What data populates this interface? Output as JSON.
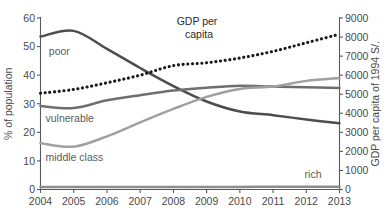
{
  "chart_data": {
    "type": "line",
    "title": "",
    "xlabel": "",
    "ylabel": "% of population",
    "y2label": "GDP per capita of 1994 S/.",
    "grid": false,
    "legend_position": "inline-labels",
    "categories": [
      "2004",
      "2005",
      "2006",
      "2007",
      "2008",
      "2009",
      "2010",
      "2011",
      "2012",
      "2013"
    ],
    "x": [
      2004,
      2005,
      2006,
      2007,
      2008,
      2009,
      2010,
      2011,
      2012,
      2013
    ],
    "xlim": [
      2004,
      2013
    ],
    "ylim": [
      0,
      60
    ],
    "yticks": [
      0,
      10,
      20,
      30,
      40,
      50,
      60
    ],
    "y2lim": [
      0,
      9000
    ],
    "y2ticks": [
      0,
      1000,
      2000,
      3000,
      4000,
      5000,
      6000,
      7000,
      8000,
      9000
    ],
    "series": [
      {
        "name": "poor",
        "axis": "left",
        "style": "solid",
        "color": "#4d4d4d",
        "values": [
          53.5,
          55.5,
          49.2,
          42.5,
          36.2,
          30.8,
          27.3,
          26.0,
          24.5,
          23.2
        ]
      },
      {
        "name": "vulnerable",
        "axis": "left",
        "style": "solid",
        "color": "#6e6e6e",
        "values": [
          29.2,
          28.5,
          31.2,
          33.0,
          34.6,
          35.6,
          36.3,
          36.0,
          35.8,
          35.5
        ]
      },
      {
        "name": "middle class",
        "axis": "left",
        "style": "solid",
        "color": "#a0a0a0",
        "values": [
          16.2,
          15.0,
          18.6,
          23.5,
          28.2,
          32.4,
          35.2,
          36.0,
          38.0,
          39.0
        ]
      },
      {
        "name": "rich",
        "axis": "left",
        "style": "solid",
        "color": "#8d8d8d",
        "values": [
          0.9,
          0.9,
          0.9,
          0.9,
          0.9,
          0.9,
          0.9,
          1.0,
          1.0,
          1.0
        ]
      },
      {
        "name": "GDP per capita",
        "axis": "right",
        "style": "dotted",
        "color": "#1a1a1a",
        "values": [
          5050,
          5250,
          5600,
          6000,
          6500,
          6650,
          6900,
          7250,
          7700,
          8150
        ]
      }
    ],
    "annotations": [
      {
        "text": "GDP per",
        "x": 2008.1,
        "y_percent": 57.5
      },
      {
        "text": "capita",
        "x": 2008.35,
        "y_percent": 53.0
      },
      {
        "text": "poor",
        "x": 2004.25,
        "y_percent": 47.0
      },
      {
        "text": "vulnerable",
        "x": 2004.15,
        "y_percent": 23.5
      },
      {
        "text": "middle class",
        "x": 2004.15,
        "y_percent": 10.0
      },
      {
        "text": "rich",
        "x": 2011.95,
        "y_percent": 4.0
      }
    ]
  },
  "axes": {
    "left_title": "% of population",
    "right_title": "GDP per capita of 1994 S/.",
    "left_ticks": [
      "0",
      "10",
      "20",
      "30",
      "40",
      "50",
      "60"
    ],
    "right_ticks": [
      "0",
      "1000",
      "2000",
      "3000",
      "4000",
      "5000",
      "6000",
      "7000",
      "8000",
      "9000"
    ],
    "x_ticks": [
      "2004",
      "2005",
      "2006",
      "2007",
      "2008",
      "2009",
      "2010",
      "2011",
      "2012",
      "2013"
    ]
  },
  "labels": {
    "poor": "poor",
    "vulnerable": "vulnerable",
    "middle_class": "middle class",
    "rich": "rich",
    "gdp_line1": "GDP per",
    "gdp_line2": "capita"
  },
  "colors": {
    "poor": "#4d4d4d",
    "vulnerable": "#6e6e6e",
    "middle_class": "#a0a0a0",
    "rich": "#8d8d8d",
    "gdp": "#1a1a1a",
    "axis": "#5a5a5a",
    "background": "#ffffff"
  }
}
